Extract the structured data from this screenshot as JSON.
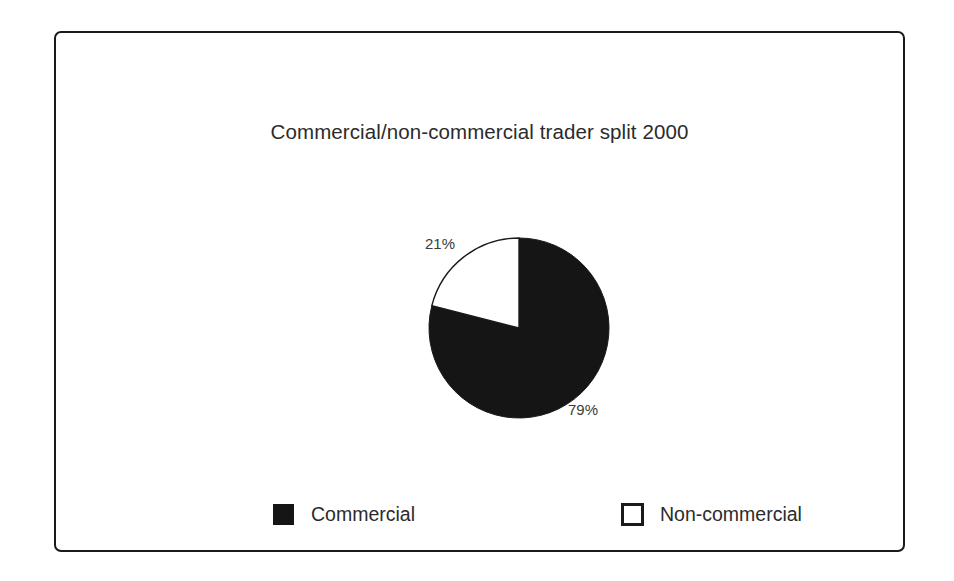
{
  "chart_data": {
    "type": "pie",
    "title": "Commercial/non-commercial trader split 2000",
    "categories": [
      "Commercial",
      "Non-commercial"
    ],
    "values": [
      79,
      21
    ],
    "value_unit": "%",
    "data_labels": [
      "79%",
      "21%"
    ],
    "colors": [
      "#151515",
      "#ffffff"
    ],
    "start_angle_deg": 0,
    "direction": "clockwise",
    "legend_position": "bottom",
    "grid": false,
    "xlabel": "",
    "ylabel": "",
    "slices": [
      {
        "name": "Commercial",
        "value": 79,
        "label": "79%",
        "fill": "#151515",
        "stroke": "#1a1a1a",
        "start_deg": 0,
        "end_deg": 284.4
      },
      {
        "name": "Non-commercial",
        "value": 21,
        "label": "21%",
        "fill": "#ffffff",
        "stroke": "#1a1a1a",
        "start_deg": 284.4,
        "end_deg": 360
      }
    ]
  },
  "frame": {
    "border_color": "#1a1a1a",
    "background": "#ffffff"
  },
  "legend": {
    "items": [
      {
        "label": "Commercial",
        "swatch": "filled-square-black",
        "color": "#151515"
      },
      {
        "label": "Non-commercial",
        "swatch": "hollow-square-black-outline",
        "color": "#ffffff"
      }
    ]
  }
}
